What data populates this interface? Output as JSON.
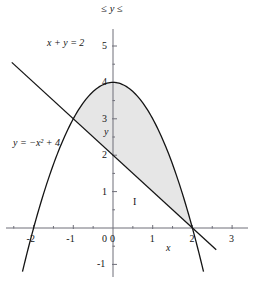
{
  "figure": {
    "top_label": "≤ y ≤",
    "region_label": "I",
    "x_axis_name": "x",
    "y_axis_name": "y"
  },
  "equations": {
    "line": "x + y = 2",
    "parabola": "y = −x² + 4"
  },
  "colors": {
    "curve": "#141414",
    "axis": "#6e6e78",
    "shade_fill": "#e6e6e6",
    "text": "#141414",
    "background": "#ffffff"
  },
  "chart_data": {
    "type": "line",
    "title": "",
    "subtitle": "",
    "xlabel": "x",
    "ylabel": "y",
    "xlim": [
      -3,
      3
    ],
    "ylim": [
      -1,
      5
    ],
    "grid": false,
    "legend_position": "inline-annotations",
    "x_ticks": [
      -3,
      -2,
      -1,
      0,
      1,
      2,
      3
    ],
    "x_tick_labels": [
      "-3",
      "-2",
      "-1",
      "0",
      "1",
      "2",
      "3"
    ],
    "y_ticks": [
      -1,
      0,
      1,
      2,
      3,
      4,
      5
    ],
    "y_tick_labels": [
      "-1",
      "0",
      "1",
      "2",
      "3",
      "4",
      "5"
    ],
    "series": [
      {
        "name": "x + y = 2",
        "type": "line",
        "equation": "y = 2 - x",
        "annotation": "x + y = 2",
        "x": [
          -2.55,
          2.6
        ],
        "values": [
          4.55,
          -0.6
        ]
      },
      {
        "name": "y = -x^2 + 4",
        "type": "curve",
        "equation": "y = -x^2 + 4",
        "annotation": "y = −x² + 4",
        "vertex": [
          0,
          4
        ],
        "x_roots": [
          -2,
          2
        ],
        "x_range": [
          -2.28,
          2.28
        ],
        "y_at_range_ends": [
          -1.2,
          -1.2
        ]
      }
    ],
    "intersections": [
      {
        "x": -1,
        "y": 3
      },
      {
        "x": 2,
        "y": 0
      }
    ],
    "shaded_region": {
      "label": "I",
      "description": "Region between line x + y = 2 (lower boundary) and parabola y = -x^2 + 4 (upper boundary) from x = -1 to x = 2",
      "x_from": -1,
      "x_to": 2,
      "upper_boundary": "y = -x^2 + 4",
      "lower_boundary": "y = 2 - x",
      "fill": "#e6e6e6"
    }
  },
  "tick_labels_x": [
    {
      "text": "-3",
      "x": -3
    },
    {
      "text": "-2",
      "x": -2
    },
    {
      "text": "-1",
      "x": -1
    },
    {
      "text": "0",
      "x": 0
    },
    {
      "text": "1",
      "x": 1
    },
    {
      "text": "2",
      "x": 2
    },
    {
      "text": "3",
      "x": 3
    }
  ],
  "tick_labels_y": [
    {
      "text": "5",
      "y": 5
    },
    {
      "text": "4",
      "y": 4
    },
    {
      "text": "3",
      "y": 3
    },
    {
      "text": "2",
      "y": 2
    },
    {
      "text": "1",
      "y": 1
    },
    {
      "text": "-1",
      "y": -1
    }
  ]
}
